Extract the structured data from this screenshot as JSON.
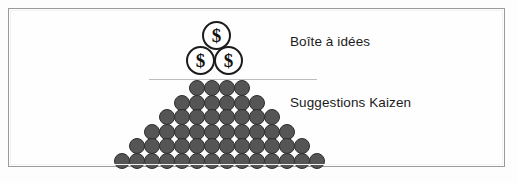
{
  "figure": {
    "title_text": null,
    "border_color": "#9a9a9a",
    "background_color": "#fefefe"
  },
  "coins": {
    "symbol": "$",
    "count": 3,
    "items": [
      {
        "position": "top",
        "symbol": "$"
      },
      {
        "position": "left",
        "symbol": "$"
      },
      {
        "position": "right",
        "symbol": "$"
      }
    ],
    "fill_color": "#ffffff",
    "stroke_color": "#1c1c1c"
  },
  "divider": {
    "color": "#bdbdbd"
  },
  "labels": {
    "idea_box": "Boîte à idées",
    "kaizen": "Suggestions Kaizen",
    "text_color": "#1b1b1b"
  },
  "pyramid": {
    "rows": [
      4,
      6,
      8,
      10,
      12,
      14
    ],
    "total_dots": 54,
    "dot_fill_color": "#555555",
    "dot_stroke_color": "#2e2e2e"
  }
}
